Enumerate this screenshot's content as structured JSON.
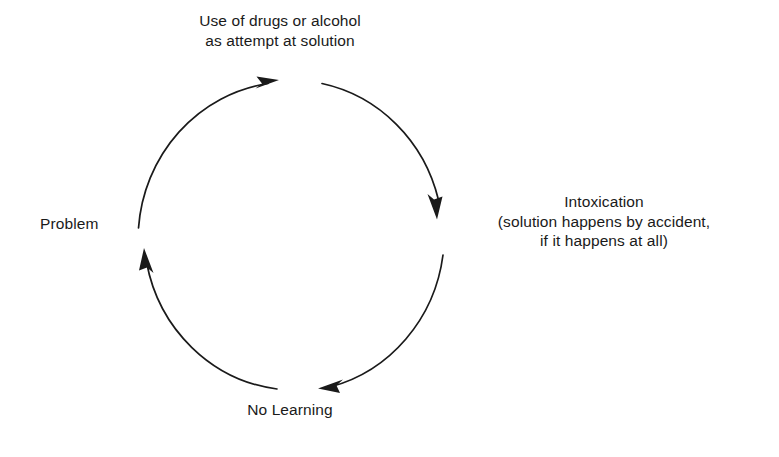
{
  "diagram": {
    "type": "cycle",
    "direction": "clockwise",
    "stroke_color": "#1a1a1a",
    "background_color": "#ffffff",
    "nodes": [
      {
        "id": "drug-use",
        "position": "top",
        "lines": [
          "Use of drugs or alcohol",
          "as attempt at solution"
        ]
      },
      {
        "id": "intoxication",
        "position": "right",
        "lines": [
          "Intoxication",
          "(solution happens by accident,",
          "if it happens at all)"
        ]
      },
      {
        "id": "no-learning",
        "position": "bottom",
        "lines": [
          "No Learning"
        ]
      },
      {
        "id": "problem",
        "position": "left",
        "lines": [
          "Problem"
        ]
      }
    ],
    "arrows": [
      {
        "id": "problem-to-drug-use",
        "from": "problem",
        "to": "drug-use",
        "quadrant": "upper-left"
      },
      {
        "id": "drug-use-to-intoxication",
        "from": "drug-use",
        "to": "intoxication",
        "quadrant": "upper-right"
      },
      {
        "id": "intoxication-to-no-learning",
        "from": "intoxication",
        "to": "no-learning",
        "quadrant": "lower-right"
      },
      {
        "id": "no-learning-to-problem",
        "from": "no-learning",
        "to": "problem",
        "quadrant": "lower-left"
      }
    ]
  }
}
